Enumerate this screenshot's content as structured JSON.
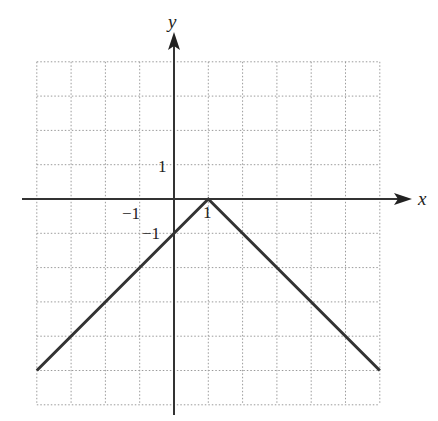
{
  "chart_data": {
    "type": "line",
    "title": "",
    "xlabel": "x",
    "ylabel": "y",
    "function": "y = -|x - 1|",
    "xlim": [
      -4,
      6
    ],
    "ylim": [
      -6,
      4
    ],
    "grid": true,
    "grid_style": "dotted",
    "tick_labels": {
      "x": [
        {
          "value": -1,
          "label": "−1"
        },
        {
          "value": 1,
          "label": "1"
        }
      ],
      "y": [
        {
          "value": 1,
          "label": "1"
        },
        {
          "value": -1,
          "label": "−1"
        }
      ]
    },
    "series": [
      {
        "name": "graph",
        "x": [
          -4,
          1,
          6
        ],
        "y": [
          -5,
          0,
          -5
        ],
        "color": "#333333"
      }
    ]
  },
  "labels": {
    "x_axis": "x",
    "y_axis": "y",
    "x_neg1": "−1",
    "x_pos1": "1",
    "y_pos1": "1",
    "y_neg1": "−1"
  }
}
